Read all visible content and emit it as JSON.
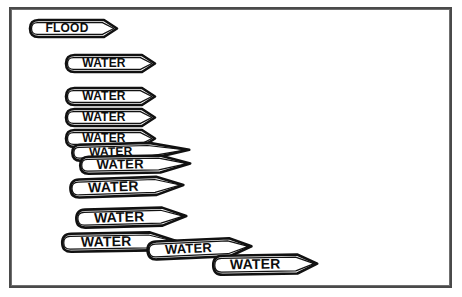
{
  "figure": {
    "background_color": "#ffffff",
    "ink_color": "#111111",
    "border_color": "#4a4a4a",
    "border": {
      "x": 9,
      "y": 7,
      "width": 443,
      "height": 281
    }
  },
  "tags": [
    {
      "label": "FLOOD",
      "x": 26,
      "y": 16,
      "width": 74,
      "height": 17,
      "tip": 13,
      "rotation": 0,
      "font_size": 12,
      "double_outline": true
    },
    {
      "label": "WATER",
      "x": 62,
      "y": 51,
      "width": 76,
      "height": 17,
      "tip": 13,
      "rotation": 0,
      "font_size": 12,
      "double_outline": true
    },
    {
      "label": "WATER",
      "x": 62,
      "y": 84,
      "width": 76,
      "height": 17,
      "tip": 13,
      "rotation": 0,
      "font_size": 12,
      "double_outline": true
    },
    {
      "label": "WATER",
      "x": 62,
      "y": 105,
      "width": 76,
      "height": 17,
      "tip": 13,
      "rotation": 0,
      "font_size": 12,
      "double_outline": true
    },
    {
      "label": "WATER",
      "x": 62,
      "y": 126,
      "width": 76,
      "height": 17,
      "tip": 13,
      "rotation": 0,
      "font_size": 12,
      "double_outline": true
    },
    {
      "label": "WATER",
      "x": 68,
      "y": 141,
      "width": 77,
      "height": 16,
      "tip": 40,
      "rotation": -1.5,
      "font_size": 12,
      "double_outline": true
    },
    {
      "label": "WATER",
      "x": 76,
      "y": 153,
      "width": 80,
      "height": 17,
      "tip": 30,
      "rotation": -1,
      "font_size": 13,
      "double_outline": true
    },
    {
      "label": "WATER",
      "x": 66,
      "y": 176,
      "width": 86,
      "height": 18,
      "tip": 27,
      "rotation": -2,
      "font_size": 14,
      "double_outline": true
    },
    {
      "label": "WATER",
      "x": 72,
      "y": 206,
      "width": 86,
      "height": 18,
      "tip": 24,
      "rotation": -1.5,
      "font_size": 14,
      "double_outline": true
    },
    {
      "label": "WATER",
      "x": 58,
      "y": 230,
      "width": 88,
      "height": 18,
      "tip": 26,
      "rotation": -1,
      "font_size": 14,
      "double_outline": true
    },
    {
      "label": "WATER",
      "x": 143,
      "y": 238,
      "width": 82,
      "height": 18,
      "tip": 22,
      "rotation": -2.5,
      "font_size": 13,
      "double_outline": true
    },
    {
      "label": "WATER",
      "x": 209,
      "y": 252,
      "width": 84,
      "height": 19,
      "tip": 20,
      "rotation": -1,
      "font_size": 14,
      "double_outline": true
    }
  ]
}
